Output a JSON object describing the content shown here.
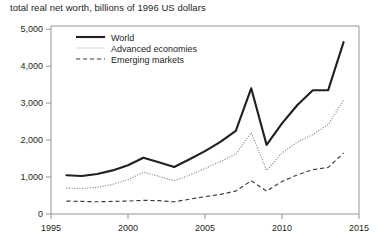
{
  "chart_data": {
    "type": "line",
    "title": "total real net worth, billions of 1996 US dollars",
    "xlabel": "",
    "ylabel": "",
    "xlim": [
      1995,
      2015
    ],
    "ylim": [
      0,
      5000
    ],
    "grid": false,
    "legend_position": "top-left-inside",
    "xticks": [
      "1995",
      "2000",
      "2005",
      "2010",
      "2015"
    ],
    "xtick_values": [
      1995,
      2000,
      2005,
      2010,
      2015
    ],
    "yticks": [
      "0",
      "1,000",
      "2,000",
      "3,000",
      "4,000",
      "5,000"
    ],
    "ytick_values": [
      0,
      1000,
      2000,
      3000,
      4000,
      5000
    ],
    "x": [
      1996,
      1997,
      1998,
      1999,
      2000,
      2001,
      2002,
      2003,
      2004,
      2005,
      2006,
      2007,
      2008,
      2009,
      2010,
      2011,
      2012,
      2013,
      2014
    ],
    "series": [
      {
        "name": "World",
        "style": "solid",
        "color": "#231f20",
        "values": [
          1050,
          1030,
          1080,
          1180,
          1320,
          1520,
          1400,
          1270,
          1480,
          1700,
          1950,
          2250,
          3400,
          1870,
          2450,
          2950,
          3350,
          3350,
          4650
        ]
      },
      {
        "name": "Advanced economies",
        "style": "dotted",
        "color": "#9a9a9a",
        "values": [
          700,
          690,
          720,
          800,
          930,
          1130,
          1020,
          900,
          1050,
          1230,
          1420,
          1620,
          2200,
          1180,
          1650,
          1950,
          2150,
          2420,
          3080
        ]
      },
      {
        "name": "Emerging markets",
        "style": "dashed",
        "color": "#3d3d3d",
        "values": [
          350,
          340,
          330,
          340,
          350,
          370,
          360,
          330,
          400,
          470,
          530,
          620,
          900,
          620,
          880,
          1060,
          1200,
          1260,
          1650
        ]
      }
    ]
  },
  "legend": {
    "items": [
      {
        "label": "World"
      },
      {
        "label": "Advanced economies"
      },
      {
        "label": "Emerging markets"
      }
    ]
  }
}
